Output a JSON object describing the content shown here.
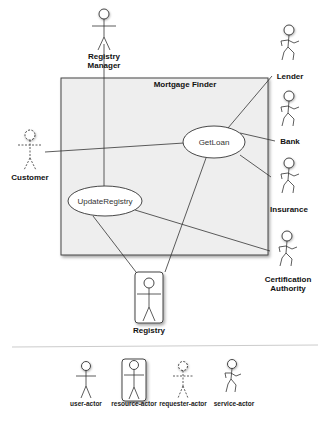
{
  "diagram": {
    "system_box": {
      "title": "Mortgage Finder",
      "fill": "#eeeeee"
    },
    "use_cases": [
      {
        "id": "getloan",
        "label": "GetLoan"
      },
      {
        "id": "updateregistry",
        "label": "UpdateRegistry"
      }
    ],
    "actors": {
      "registry_manager": {
        "label_line1": "Registry",
        "label_line2": "Manager",
        "type": "user-actor"
      },
      "customer": {
        "label": "Customer",
        "type": "requester-actor"
      },
      "lender": {
        "label": "Lender",
        "type": "service-actor"
      },
      "bank": {
        "label": "Bank",
        "type": "service-actor"
      },
      "insurance": {
        "label": "Insurance",
        "type": "service-actor"
      },
      "certification_authority": {
        "label_line1": "Certification",
        "label_line2": "Authority",
        "type": "service-actor"
      },
      "registry": {
        "label": "Registry",
        "type": "resource-actor"
      }
    }
  },
  "legend": {
    "items": [
      {
        "label": "user-actor"
      },
      {
        "label": "resource-actor"
      },
      {
        "label": "requester-actor"
      },
      {
        "label": "service-actor"
      }
    ]
  }
}
